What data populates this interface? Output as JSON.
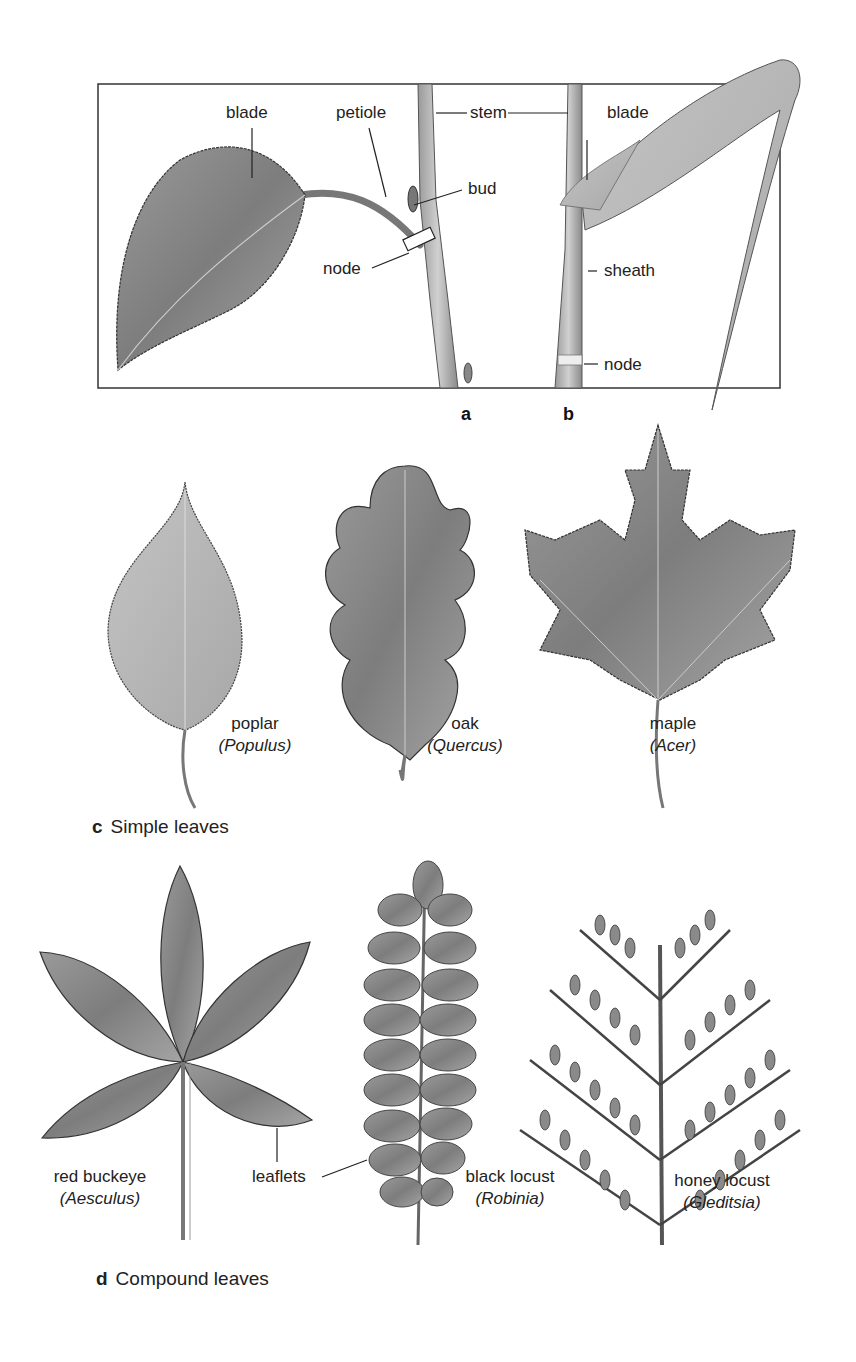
{
  "panel_a": {
    "letter": "a",
    "labels": {
      "blade": "blade",
      "petiole": "petiole",
      "stem": "stem",
      "bud": "bud",
      "node": "node"
    }
  },
  "panel_b": {
    "letter": "b",
    "labels": {
      "blade": "blade",
      "sheath": "sheath",
      "node": "node"
    }
  },
  "panel_c": {
    "letter": "c",
    "caption": "Simple leaves",
    "leaves": [
      {
        "common": "poplar",
        "genus": "(Populus)"
      },
      {
        "common": "oak",
        "genus": "(Quercus)"
      },
      {
        "common": "maple",
        "genus": "(Acer)"
      }
    ]
  },
  "panel_d": {
    "letter": "d",
    "caption": "Compound leaves",
    "leaflets_label": "leaflets",
    "leaves": [
      {
        "common": "red buckeye",
        "genus": "(Aesculus)"
      },
      {
        "common": "black locust",
        "genus": "(Robinia)"
      },
      {
        "common": "honey locust",
        "genus": "(Gleditsia)"
      }
    ]
  },
  "colors": {
    "leaf_fill": "#8f8f8f",
    "leaf_light": "#b9b9b9",
    "outline": "#3a3a3a",
    "frame": "#333333"
  }
}
